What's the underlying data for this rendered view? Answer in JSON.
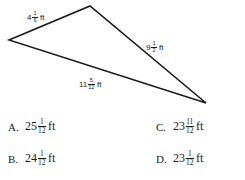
{
  "figure": {
    "shape": "triangle",
    "vertices": {
      "left": [
        9,
        40
      ],
      "top": [
        90,
        6
      ],
      "right": [
        206,
        103
      ]
    },
    "stroke_color": "#1a1a1a",
    "sides": [
      {
        "id": "side-top-left",
        "whole": "4",
        "numerator": "1",
        "denominator": "6",
        "unit": "ft"
      },
      {
        "id": "side-right",
        "whole": "9",
        "numerator": "1",
        "denominator": "2",
        "unit": "ft"
      },
      {
        "id": "side-bottom",
        "whole": "11",
        "numerator": "5",
        "denominator": "12",
        "unit": "ft"
      }
    ]
  },
  "choices": [
    {
      "letter": "A.",
      "whole": "25",
      "numerator": "1",
      "denominator": "12",
      "unit": "ft"
    },
    {
      "letter": "B.",
      "whole": "24",
      "numerator": "1",
      "denominator": "12",
      "unit": "ft"
    },
    {
      "letter": "C.",
      "whole": "23",
      "numerator": "11",
      "denominator": "12",
      "unit": "ft"
    },
    {
      "letter": "D.",
      "whole": "23",
      "numerator": "1",
      "denominator": "12",
      "unit": "ft"
    }
  ]
}
